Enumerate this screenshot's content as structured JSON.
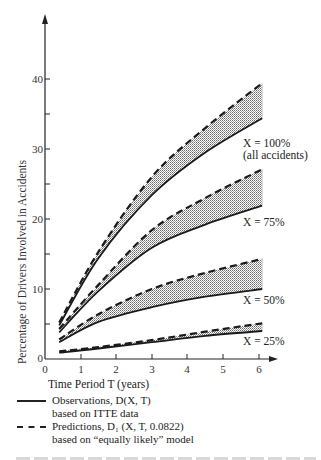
{
  "chart_data": {
    "type": "line",
    "title": "",
    "xlabel": "Time Period T (years)",
    "ylabel": "Percentage of Drivers Involved in Accidents",
    "xlim": [
      0,
      6.4
    ],
    "ylim": [
      0,
      45
    ],
    "xticks": [
      0,
      1,
      2,
      3,
      4,
      5,
      6
    ],
    "yticks": [
      0,
      10,
      20,
      30,
      40
    ],
    "yticks_minor": [
      5,
      15,
      25,
      35
    ],
    "grid": false,
    "shaded_between_series": true,
    "legend": [
      {
        "style": "solid",
        "label": "Observations, D(X, T)",
        "sublabel": "based on ITTE data"
      },
      {
        "style": "dashed",
        "label": "Predictions, D₁ (X, T, 0.0822)",
        "sublabel": "based on “equally likely” model"
      }
    ],
    "x": [
      0.4,
      1.5,
      3.0,
      4.5,
      6.1
    ],
    "groups": [
      {
        "name": "X = 100%",
        "annotation": [
          "X = 100%",
          "(all accidents)"
        ],
        "series": [
          {
            "name": "Observations D(X,T)",
            "style": "solid",
            "values": [
              4.8,
              14.4,
              23.4,
              29.5,
              34.4
            ]
          },
          {
            "name": "Predictions D1(X,T,0.0822)",
            "style": "dashed",
            "values": [
              5.2,
              15.3,
              26.0,
              33.0,
              39.4
            ]
          }
        ]
      },
      {
        "name": "X = 75%",
        "annotation": [
          "X = 75%"
        ],
        "series": [
          {
            "name": "Observations D(X,T)",
            "style": "solid",
            "values": [
              3.8,
              9.7,
              15.9,
              19.2,
              21.9
            ]
          },
          {
            "name": "Predictions D1(X,T,0.0822)",
            "style": "dashed",
            "values": [
              4.3,
              10.6,
              18.4,
              23.0,
              27.1
            ]
          }
        ]
      },
      {
        "name": "X = 50%",
        "annotation": [
          "X = 50%"
        ],
        "series": [
          {
            "name": "Observations D(X,T)",
            "style": "solid",
            "values": [
              2.4,
              5.3,
              7.4,
              8.9,
              10.0
            ]
          },
          {
            "name": "Predictions D1(X,T,0.0822)",
            "style": "dashed",
            "values": [
              2.8,
              6.4,
              10.0,
              12.3,
              14.3
            ]
          }
        ]
      },
      {
        "name": "X = 25%",
        "annotation": [
          "X = 25%"
        ],
        "series": [
          {
            "name": "Observations D(X,T)",
            "style": "solid",
            "values": [
              0.9,
              1.5,
              2.4,
              3.3,
              4.0
            ]
          },
          {
            "name": "Predictions D1(X,T,0.0822)",
            "style": "dashed",
            "values": [
              1.1,
              1.7,
              2.7,
              3.9,
              5.1
            ]
          }
        ]
      }
    ]
  },
  "labels": {
    "xlabel": "Time Period T (years)",
    "ylabel": "Percentage of Drivers Involved in Accidents",
    "ann_100_a": "X = 100%",
    "ann_100_b": "(all accidents)",
    "ann_75": "X = 75%",
    "ann_50": "X = 50%",
    "ann_25": "X = 25%",
    "xt0": "0",
    "xt1": "1",
    "xt2": "2",
    "xt3": "3",
    "xt4": "4",
    "xt5": "5",
    "xt6": "6",
    "yt0": "0",
    "yt10": "10",
    "yt20": "20",
    "yt30": "30",
    "yt40": "40"
  },
  "legend": {
    "obs_label": "Observations, D(X, T)",
    "obs_sub": "based on ITTE data",
    "pred_label": "Predictions, D₁ (X, T, 0.0822)",
    "pred_sub": "based on “equally likely” model"
  }
}
